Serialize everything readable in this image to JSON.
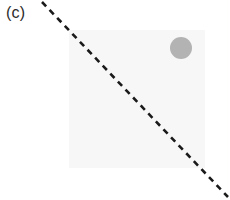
{
  "figure": {
    "panel_label": "(c)",
    "width": 230,
    "height": 200,
    "background_color": "#ffffff"
  },
  "chart_data": {
    "type": "scatter",
    "title": "(c)",
    "subtitle": "",
    "xlabel": "",
    "ylabel": "",
    "xlim": [
      0,
      230
    ],
    "ylim": [
      0,
      200
    ],
    "grid": false,
    "legend": null,
    "axes_visible": false,
    "tick_labels": {
      "x": [],
      "y": []
    },
    "shapes": [
      {
        "name": "field-square",
        "kind": "rect",
        "x": 69,
        "y": 30,
        "width": 136,
        "height": 138,
        "fill": "#f7f7f7",
        "stroke": "none"
      },
      {
        "name": "circle-marker",
        "kind": "circle",
        "cx": 181,
        "cy": 48,
        "r": 11,
        "fill": "#b3b3b3",
        "stroke": "none"
      },
      {
        "name": "dashed-diagonal-line",
        "kind": "line",
        "x1": 42,
        "y1": 2,
        "x2": 228,
        "y2": 197,
        "stroke": "#1a1a1a",
        "stroke_width": 2.6,
        "dash_length": 6,
        "gap_length": 5,
        "slope": 1.048
      }
    ]
  },
  "colors": {
    "background": "#ffffff",
    "field_fill": "#f7f7f7",
    "circle_fill": "#b3b3b3",
    "line_stroke": "#1a1a1a",
    "label_text": "#2b2b2b"
  }
}
